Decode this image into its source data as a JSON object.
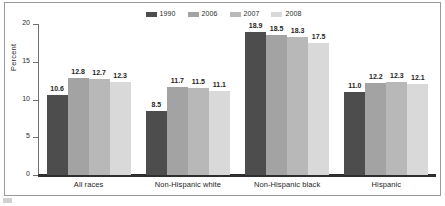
{
  "chart_data": {
    "type": "bar",
    "title": "",
    "subtitle": "",
    "xlabel": "",
    "ylabel": "Percent",
    "ylim": [
      0,
      20
    ],
    "yticks": [
      "0",
      "5",
      "10",
      "15",
      "20"
    ],
    "grid": false,
    "legend_position": "top-center",
    "categories": [
      "All races",
      "Non-Hispanic white",
      "Non-Hispanic black",
      "Hispanic"
    ],
    "series": [
      {
        "name": "1990",
        "color": "#4d4d4d",
        "values": [
          10.6,
          8.5,
          18.9,
          11.0
        ],
        "labels": [
          "10.6",
          "8.5",
          "18.9",
          "11.0"
        ]
      },
      {
        "name": "2006",
        "color": "#a3a3a3",
        "values": [
          12.8,
          11.7,
          18.5,
          12.2
        ],
        "labels": [
          "12.8",
          "11.7",
          "18.5",
          "12.2"
        ]
      },
      {
        "name": "2007",
        "color": "#b8b8b8",
        "values": [
          12.7,
          11.5,
          18.3,
          12.3
        ],
        "labels": [
          "12.7",
          "11.5",
          "18.3",
          "12.3"
        ]
      },
      {
        "name": "2008",
        "color": "#d9d9d9",
        "values": [
          12.3,
          11.1,
          17.5,
          12.1
        ],
        "labels": [
          "12.3",
          "11.1",
          "17.5",
          "12.1"
        ]
      }
    ]
  },
  "legend": {
    "items": [
      {
        "label": "1990",
        "color": "#4d4d4d"
      },
      {
        "label": "2006",
        "color": "#a3a3a3"
      },
      {
        "label": "2007",
        "color": "#b8b8b8"
      },
      {
        "label": "2008",
        "color": "#d9d9d9"
      }
    ]
  },
  "axis": {
    "y_title": "Percent",
    "y_ticks": [
      "20",
      "15",
      "10",
      "5",
      "0"
    ]
  },
  "colors": {
    "frame": "#9a9a9a",
    "axis": "#6f6f6f",
    "baseline": "#2f2f2f",
    "text": "#1e1e1e",
    "background": "#ffffff"
  }
}
